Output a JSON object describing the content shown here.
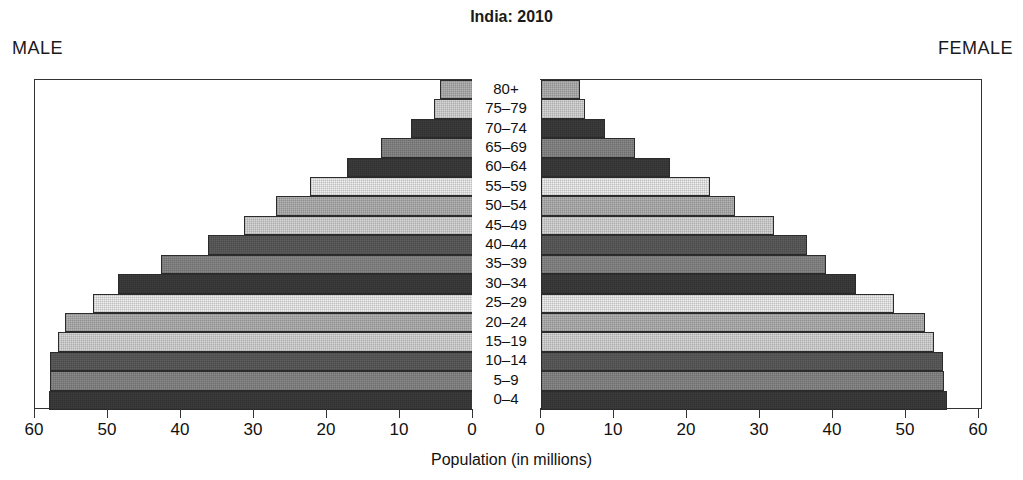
{
  "title": "India: 2010",
  "labels": {
    "male": "MALE",
    "female": "FEMALE",
    "axis_caption": "Population (in millions)"
  },
  "axis": {
    "tick_values": [
      60,
      50,
      40,
      30,
      20,
      10,
      0
    ],
    "tick_values_right": [
      0,
      10,
      20,
      30,
      40,
      50,
      60
    ],
    "max": 60,
    "unit": "millions"
  },
  "colors": {
    "frame": "#333333",
    "bar_outline": "#2b2b2b",
    "background": "#ffffff",
    "text": "#111111"
  },
  "chart_data": {
    "type": "bar",
    "subtype": "population-pyramid",
    "title": "India: 2010",
    "xlabel": "Population (in millions)",
    "ylabel": "",
    "xlim": [
      0,
      60
    ],
    "grid": false,
    "legend": "none",
    "categories": [
      "80+",
      "75–79",
      "70–74",
      "65–69",
      "60–64",
      "55–59",
      "50–54",
      "45–49",
      "40–44",
      "35–39",
      "30–34",
      "25–29",
      "20–24",
      "15–19",
      "10–14",
      "5–9",
      "0–4"
    ],
    "series": [
      {
        "name": "MALE",
        "side": "left",
        "values": [
          4.5,
          5.4,
          8.5,
          12.6,
          17.3,
          22.3,
          27.0,
          31.4,
          36.3,
          42.7,
          48.6,
          52.0,
          55.9,
          56.9,
          57.9,
          57.9,
          58.1
        ]
      },
      {
        "name": "FEMALE",
        "side": "right",
        "values": [
          5.4,
          6.0,
          8.8,
          12.9,
          17.7,
          23.2,
          26.6,
          31.9,
          36.5,
          39.1,
          43.1,
          48.4,
          52.6,
          53.8,
          55.0,
          55.2,
          55.6
        ]
      }
    ],
    "shades": [
      "t3",
      "t2",
      "t6",
      "t4",
      "t6",
      "t1",
      "t3",
      "t2",
      "t5",
      "t4",
      "t6",
      "t1",
      "t3",
      "t2",
      "t5",
      "t4",
      "t6"
    ]
  }
}
